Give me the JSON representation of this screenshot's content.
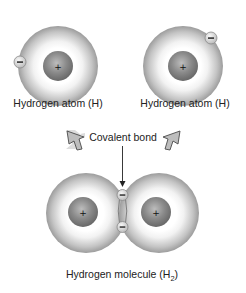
{
  "diagram": {
    "type": "covalent-bond-formation",
    "atoms": [
      {
        "label": "Hydrogen atom (H)",
        "nucleus_symbol": "+",
        "electron_symbol": "−"
      },
      {
        "label": "Hydrogen atom (H)",
        "nucleus_symbol": "+",
        "electron_symbol": "−"
      }
    ],
    "bond_label": "Covalent bond",
    "molecule": {
      "label_prefix": "Hydrogen molecule (H",
      "label_subscript": "2",
      "label_suffix": ")",
      "nucleus_symbol": "+",
      "electron_symbol": "−"
    },
    "colors": {
      "cloud_outer": "#9a9a9a",
      "cloud_inner": "#f4f4f4",
      "nucleus": "#7a7a7a",
      "arrow_fill": "#b8b8b8",
      "arrow_stroke": "#555555",
      "text": "#222222"
    }
  }
}
